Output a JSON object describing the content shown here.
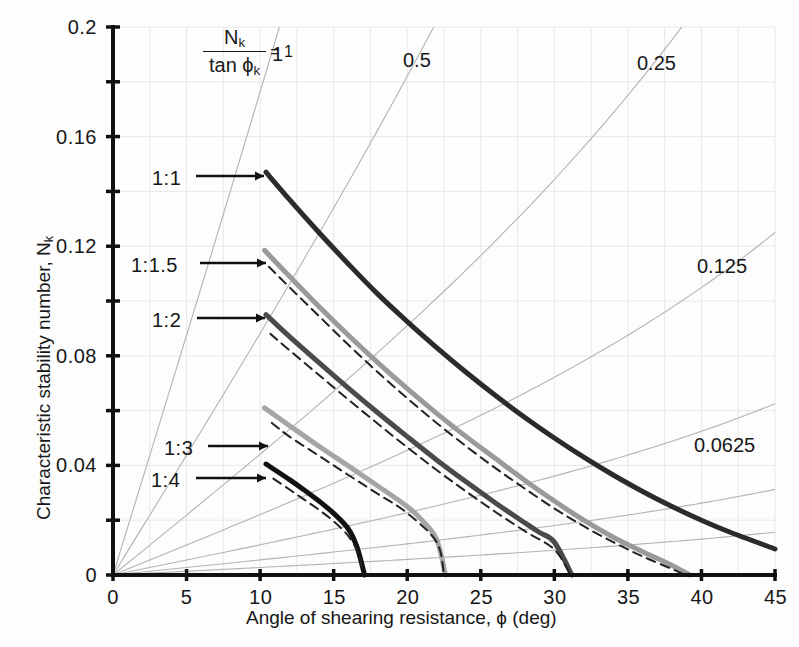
{
  "chart_data": {
    "type": "line",
    "title": "",
    "xlabel": "Angle of shearing resistance, ϕ (deg)",
    "ylabel": "Characteristic stability number, N",
    "ylabel_sub": "k",
    "xlim": [
      0,
      45
    ],
    "ylim": [
      0,
      0.2
    ],
    "grid": true,
    "grid_color": "#e8e8e8",
    "legend_position": "inline-labels",
    "x_ticks": [
      0,
      5,
      10,
      15,
      20,
      25,
      30,
      35,
      40,
      45
    ],
    "x_tick_labels": [
      "0",
      "5",
      "10",
      "15",
      "20",
      "25",
      "30",
      "35",
      "40",
      "45"
    ],
    "x_minor_step": 2.5,
    "y_ticks": [
      0,
      0.04,
      0.08,
      0.12,
      0.16,
      0.2
    ],
    "y_tick_labels": [
      "0",
      "0.04",
      "0.08",
      "0.12",
      "0.16",
      "0.2"
    ],
    "y_minor_step": 0.02,
    "annotation": {
      "numerator": "N",
      "numerator_sub": "k",
      "denominator": "tan ϕ",
      "denominator_sub": "k",
      "equals": "= 1"
    },
    "ray_labels": [
      {
        "text": "1",
        "value": 1
      },
      {
        "text": "0.5",
        "value": 0.5
      },
      {
        "text": "0.25",
        "value": 0.25
      },
      {
        "text": "0.125",
        "value": 0.125
      },
      {
        "text": "0.0625",
        "value": 0.0625
      }
    ],
    "series": [
      {
        "name": "1:1",
        "label": "1:1",
        "color": "#2b2b2b",
        "width": 5,
        "style": "solid",
        "points": [
          [
            10.4,
            0.147
          ],
          [
            12,
            0.137
          ],
          [
            14,
            0.125
          ],
          [
            16,
            0.1135
          ],
          [
            18,
            0.1025
          ],
          [
            20,
            0.0925
          ],
          [
            22,
            0.083
          ],
          [
            24,
            0.074
          ],
          [
            26,
            0.0655
          ],
          [
            28,
            0.0575
          ],
          [
            30,
            0.05
          ],
          [
            32,
            0.043
          ],
          [
            34,
            0.0365
          ],
          [
            36,
            0.0305
          ],
          [
            38,
            0.025
          ],
          [
            40,
            0.02
          ],
          [
            42,
            0.0155
          ],
          [
            45,
            0.0095
          ]
        ]
      },
      {
        "name": "1:1.5",
        "label": "1:1.5",
        "color": "#9a9a9a",
        "width": 5,
        "style": "solid",
        "points": [
          [
            10.3,
            0.1185
          ],
          [
            12,
            0.109
          ],
          [
            14,
            0.098
          ],
          [
            16,
            0.0875
          ],
          [
            18,
            0.0775
          ],
          [
            20,
            0.068
          ],
          [
            22,
            0.059
          ],
          [
            24,
            0.0505
          ],
          [
            26,
            0.0425
          ],
          [
            28,
            0.0345
          ],
          [
            30,
            0.027
          ],
          [
            32,
            0.02
          ],
          [
            34,
            0.0138
          ],
          [
            36,
            0.0085
          ],
          [
            38,
            0.0035
          ],
          [
            39.2,
            0.0
          ]
        ]
      },
      {
        "name": "1:1.5-dashed",
        "label": "",
        "color": "#222222",
        "width": 2,
        "style": "dashed",
        "points": [
          [
            10.6,
            0.1125
          ],
          [
            12,
            0.105
          ],
          [
            14,
            0.0945
          ],
          [
            16,
            0.084
          ],
          [
            18,
            0.074
          ],
          [
            20,
            0.0645
          ],
          [
            22,
            0.0555
          ],
          [
            24,
            0.047
          ],
          [
            26,
            0.039
          ],
          [
            28,
            0.0315
          ],
          [
            30,
            0.0243
          ],
          [
            32,
            0.0178
          ],
          [
            34,
            0.012
          ],
          [
            36,
            0.0068
          ],
          [
            38,
            0.0022
          ],
          [
            38.9,
            0.0
          ]
        ]
      },
      {
        "name": "1:2",
        "label": "1:2",
        "color": "#4a4a4a",
        "width": 5,
        "style": "solid",
        "points": [
          [
            10.4,
            0.095
          ],
          [
            12,
            0.087
          ],
          [
            14,
            0.0775
          ],
          [
            16,
            0.0682
          ],
          [
            18,
            0.0592
          ],
          [
            20,
            0.0505
          ],
          [
            22,
            0.042
          ],
          [
            24,
            0.034
          ],
          [
            26,
            0.0263
          ],
          [
            28,
            0.019
          ],
          [
            29,
            0.0155
          ],
          [
            30,
            0.012
          ],
          [
            31.2,
            0.0
          ]
        ]
      },
      {
        "name": "1:2-dashed",
        "label": "",
        "color": "#222222",
        "width": 2,
        "style": "dashed",
        "points": [
          [
            10.7,
            0.088
          ],
          [
            12,
            0.082
          ],
          [
            14,
            0.073
          ],
          [
            16,
            0.064
          ],
          [
            18,
            0.0552
          ],
          [
            20,
            0.0466
          ],
          [
            22,
            0.0383
          ],
          [
            24,
            0.0305
          ],
          [
            26,
            0.023
          ],
          [
            28,
            0.016
          ],
          [
            30,
            0.0093
          ],
          [
            31.1,
            0.0
          ]
        ]
      },
      {
        "name": "1:3",
        "label": "1:3",
        "color": "#a5a5a5",
        "width": 5,
        "style": "solid",
        "points": [
          [
            10.3,
            0.061
          ],
          [
            12,
            0.0545
          ],
          [
            14,
            0.047
          ],
          [
            16,
            0.0398
          ],
          [
            18,
            0.0325
          ],
          [
            20,
            0.025
          ],
          [
            21,
            0.02
          ],
          [
            22,
            0.013
          ],
          [
            22.6,
            0.0
          ]
        ]
      },
      {
        "name": "1:3-dashed",
        "label": "",
        "color": "#222222",
        "width": 2,
        "style": "dashed",
        "points": [
          [
            10.8,
            0.0555
          ],
          [
            12,
            0.0505
          ],
          [
            14,
            0.0435
          ],
          [
            16,
            0.0365
          ],
          [
            18,
            0.0296
          ],
          [
            20,
            0.0226
          ],
          [
            22,
            0.012
          ],
          [
            22.5,
            0.0
          ]
        ]
      },
      {
        "name": "1:4",
        "label": "1:4",
        "color": "#111111",
        "width": 5,
        "style": "solid",
        "points": [
          [
            10.4,
            0.0405
          ],
          [
            12,
            0.0348
          ],
          [
            13,
            0.031
          ],
          [
            14,
            0.027
          ],
          [
            15,
            0.0225
          ],
          [
            16,
            0.0168
          ],
          [
            16.6,
            0.01
          ],
          [
            17.1,
            0.0
          ]
        ]
      },
      {
        "name": "1:4-dashed",
        "label": "",
        "color": "#222222",
        "width": 2,
        "style": "dashed",
        "points": [
          [
            10.9,
            0.0352
          ],
          [
            12,
            0.0312
          ],
          [
            13,
            0.0275
          ],
          [
            14,
            0.0238
          ],
          [
            15,
            0.0196
          ],
          [
            16,
            0.0142
          ],
          [
            16.7,
            0.0075
          ],
          [
            17.0,
            0.0
          ]
        ]
      }
    ]
  },
  "series_callouts": [
    {
      "label": "1:1",
      "lx": 152,
      "ly": 168,
      "leader_from": 196,
      "leader_to": 264,
      "leader_y": 176
    },
    {
      "label": "1:1.5",
      "lx": 131,
      "ly": 255,
      "leader_from": 200,
      "leader_to": 266,
      "leader_y": 263
    },
    {
      "label": "1:2",
      "lx": 152,
      "ly": 310,
      "leader_from": 197,
      "leader_to": 265,
      "leader_y": 318
    },
    {
      "label": "1:3",
      "lx": 164,
      "ly": 438,
      "leader_from": 208,
      "leader_to": 268,
      "leader_y": 446
    },
    {
      "label": "1:4",
      "lx": 151,
      "ly": 470,
      "leader_from": 196,
      "leader_to": 266,
      "leader_y": 478
    }
  ],
  "ray_label_positions": [
    {
      "text": "1",
      "x": 272,
      "y": 44
    },
    {
      "text": "0.5",
      "x": 403,
      "y": 50
    },
    {
      "text": "0.25",
      "x": 637,
      "y": 53
    },
    {
      "text": "0.125",
      "x": 697,
      "y": 256
    },
    {
      "text": "0.0625",
      "x": 694,
      "y": 435
    }
  ],
  "axes": {
    "x_title": "Angle of shearing resistance, ϕ (deg)",
    "y_title_main": "Characteristic stability number, N",
    "y_title_sub": "k"
  }
}
